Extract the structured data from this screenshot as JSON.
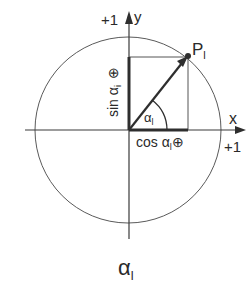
{
  "diagram": {
    "axes": {
      "x_label": "x",
      "y_label": "y",
      "x_unit_label": "+1",
      "y_unit_label": "+1"
    },
    "point": {
      "label": "P",
      "subscript": "l"
    },
    "angle": {
      "symbol": "α",
      "subscript": "l"
    },
    "sin_label": {
      "text": "sin α",
      "subscript": "i",
      "sign": "⊕"
    },
    "cos_label": {
      "text": "cos α",
      "subscript": "l",
      "sign": "⊕"
    },
    "caption": {
      "symbol": "α",
      "subscript": "l"
    },
    "colors": {
      "line": "#3a3a3a",
      "circle": "#5a5a5a",
      "background": "#ffffff"
    }
  }
}
